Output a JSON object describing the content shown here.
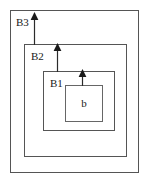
{
  "diagram": {
    "type": "nested-boxes-with-arrows",
    "canvas": {
      "width": 149,
      "height": 183,
      "background": "#ffffff"
    },
    "stroke_color": "#4d4d4d",
    "text_color": "#1a1a1a",
    "arrow_color": "#1a1a1a",
    "boxes": [
      {
        "id": "outer",
        "label": "B3",
        "level": 3,
        "x": 10,
        "y": 10,
        "width": 129,
        "height": 163,
        "label_x": 16,
        "label_y": 17
      },
      {
        "id": "b2",
        "label": "B2",
        "level": 2,
        "x": 24,
        "y": 44,
        "width": 103,
        "height": 113,
        "label_x": 31,
        "label_y": 51
      },
      {
        "id": "b1",
        "label": "B1",
        "level": 1,
        "x": 43,
        "y": 71,
        "width": 72,
        "height": 60,
        "label_x": 50,
        "label_y": 78
      },
      {
        "id": "b",
        "label": "b",
        "level": 0,
        "x": 65,
        "y": 85,
        "width": 38,
        "height": 37,
        "label_x": 65,
        "label_y": 98
      }
    ],
    "arrows": [
      {
        "id": "arrow-b3",
        "from_box": "b2",
        "to_box": "outer",
        "direction": "up",
        "x": 34,
        "y_start": 44,
        "y_end": 13
      },
      {
        "id": "arrow-b2",
        "from_box": "b1",
        "to_box": "b2",
        "direction": "up",
        "x": 57,
        "y_start": 71,
        "y_end": 43
      },
      {
        "id": "arrow-b1",
        "from_box": "b",
        "to_box": "b1",
        "direction": "up",
        "x": 82,
        "y_start": 85,
        "y_end": 69
      }
    ]
  }
}
